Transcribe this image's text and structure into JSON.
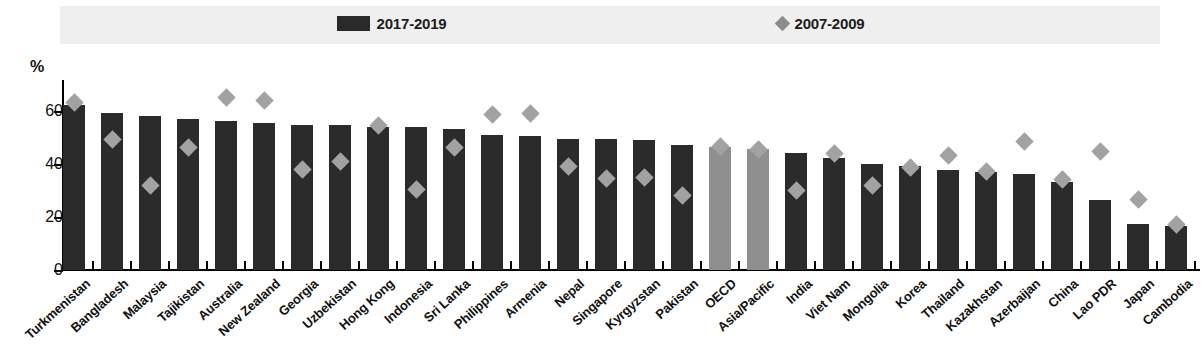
{
  "legend": {
    "items": [
      {
        "label": "2017-2019",
        "marker": "bar-swatch",
        "color": "#2a2a2a"
      },
      {
        "label": "2007-2009",
        "marker": "diamond-swatch",
        "color": "#8c8c8c"
      }
    ]
  },
  "axis": {
    "unit_label": "%",
    "y_ticks": [
      "0",
      "20",
      "40",
      "60"
    ],
    "y_min": 0,
    "y_max": 70
  },
  "chart_data": {
    "type": "bar",
    "title": "",
    "subtitle": "",
    "xlabel": "",
    "ylabel": "%",
    "ylim": [
      0,
      70
    ],
    "grid": false,
    "legend_position": "top-center",
    "note": "Bars for OECD and Asia/Pacific are rendered in grey as aggregate reference values.",
    "categories": [
      "Turkmenistan",
      "Bangladesh",
      "Malaysia",
      "Tajikistan",
      "Australia",
      "New Zealand",
      "Georgia",
      "Uzbekistan",
      "Hong Kong",
      "Indonesia",
      "Sri Lanka",
      "Philippines",
      "Armenia",
      "Nepal",
      "Singapore",
      "Kyrgyzstan",
      "Pakistan",
      "OECD",
      "Asia/Pacific",
      "India",
      "Viet Nam",
      "Mongolia",
      "Korea",
      "Thailand",
      "Kazakhstan",
      "Azerbaijan",
      "China",
      "Lao PDR",
      "Japan",
      "Cambodia"
    ],
    "aggregate_categories": [
      "OECD",
      "Asia/Pacific"
    ],
    "series": [
      {
        "name": "2017-2019",
        "type": "bar",
        "color": "#2b2b2b",
        "values": [
          62,
          59,
          58,
          57,
          56,
          55.5,
          54.5,
          54.5,
          54,
          54,
          53,
          51,
          50.5,
          49.5,
          49.5,
          49,
          47,
          46.5,
          45.5,
          44,
          42,
          40,
          39,
          37.5,
          37,
          36,
          33,
          26.5,
          17.5,
          16.5
        ]
      },
      {
        "name": "2007-2009",
        "type": "scatter",
        "color": "#a2a2a2",
        "values": [
          63,
          49,
          32,
          46,
          65,
          64,
          38,
          41,
          54.5,
          30.5,
          46,
          58.5,
          59,
          39,
          34.5,
          35,
          28,
          46.5,
          45.5,
          30,
          44,
          32,
          38.5,
          43,
          37,
          48.5,
          34,
          44.5,
          26.5,
          17
        ]
      }
    ]
  }
}
